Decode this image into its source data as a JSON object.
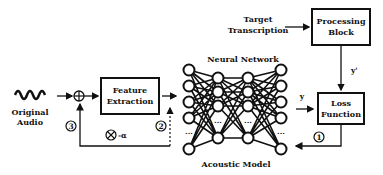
{
  "diagram": {
    "original_audio": {
      "line1": "Original",
      "line2": "Audio"
    },
    "feature_extraction": {
      "line1": "Feature",
      "line2": "Extraction"
    },
    "neural_network": {
      "title": "Neural Network",
      "caption": "Acoustic Model",
      "ellipsis": "..."
    },
    "target_transcription": {
      "line1": "Target",
      "line2": "Transcription"
    },
    "processing_block": {
      "line1": "Processing",
      "line2": "Block"
    },
    "loss_function": {
      "line1": "Loss",
      "line2": "Function"
    },
    "labels": {
      "y": "y",
      "y_prime": "y'",
      "alpha": "-α"
    },
    "steps": {
      "one": "1",
      "two": "2",
      "three": "3"
    }
  }
}
